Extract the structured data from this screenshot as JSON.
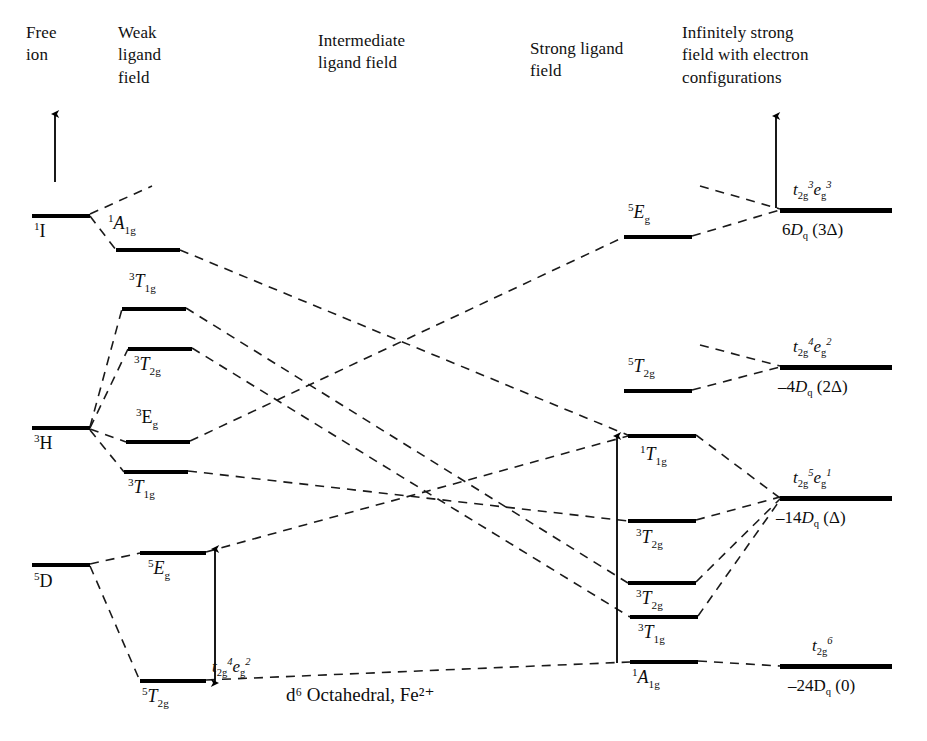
{
  "diagram": {
    "caption": "d6 Octahedral, Fe2+",
    "caption_html": "d⁶ Octahedral, Fe²⁺",
    "type": "tanabe-sugano-correlation-diagram",
    "ion": "Fe2+",
    "configuration": "d6",
    "geometry": "Octahedral"
  },
  "columns": [
    {
      "id": "free-ion",
      "title": "Free\nion"
    },
    {
      "id": "weak-field",
      "title": "Weak\nligand\nfield"
    },
    {
      "id": "intermediate-field",
      "title": "Intermediate\nligand field"
    },
    {
      "id": "strong-field",
      "title": "Strong ligand\nfield"
    },
    {
      "id": "infinite-field",
      "title": "Infinitely strong\nfield with electron\nconfigurations"
    }
  ],
  "free_ion_levels": [
    {
      "id": "1I",
      "label_html": "<sup>1</sup>I",
      "label": "1I",
      "x": 32,
      "y": 214,
      "w": 58,
      "label_x": 34,
      "label_y": 222
    },
    {
      "id": "3H",
      "label_html": "<sup>3</sup>H",
      "label": "3H",
      "x": 32,
      "y": 426,
      "w": 58,
      "label_x": 34,
      "label_y": 434
    },
    {
      "id": "5D",
      "label_html": "<sup>5</sup>D",
      "label": "5D",
      "x": 32,
      "y": 563,
      "w": 58,
      "label_x": 34,
      "label_y": 572
    }
  ],
  "weak_field_levels": [
    {
      "id": "1A1g",
      "label_html": "<sup>1</sup><i>A</i><sub>1g</sub>",
      "label": "1A1g",
      "x": 116,
      "y": 248,
      "w": 64,
      "label_x": 108,
      "label_y": 214
    },
    {
      "id": "3T1g_a",
      "label_html": "<sup>3</sup><i>T</i><sub>1g</sub>",
      "label": "3T1g",
      "x": 122,
      "y": 307,
      "w": 64,
      "label_x": 129,
      "label_y": 272
    },
    {
      "id": "3T2g",
      "label_html": "<sup>3</sup><i>T</i><sub>2g</sub>",
      "label": "3T2g",
      "x": 128,
      "y": 347,
      "w": 64,
      "label_x": 134,
      "label_y": 355
    },
    {
      "id": "3Eg",
      "label_html": "<sup>3</sup>E<sub>g</sub>",
      "label": "3Eg",
      "x": 126,
      "y": 440,
      "w": 64,
      "label_x": 136,
      "label_y": 408
    },
    {
      "id": "3T1g_b",
      "label_html": "<sup>3</sup><i>T</i><sub>1g</sub>",
      "label": "3T1g",
      "x": 124,
      "y": 470,
      "w": 64,
      "label_x": 128,
      "label_y": 478
    },
    {
      "id": "5Eg",
      "label_html": "<sup>5</sup><i>E</i><sub>g</sub>",
      "label": "5Eg",
      "x": 140,
      "y": 551,
      "w": 66,
      "label_x": 148,
      "label_y": 559
    },
    {
      "id": "5T2g",
      "label_html": "<sup>5</sup><i>T</i><sub>2g</sub>",
      "label": "5T2g",
      "x": 140,
      "y": 679,
      "w": 66,
      "label_x": 142,
      "label_y": 687
    }
  ],
  "strong_field_levels": [
    {
      "id": "5Eg_s",
      "label_html": "<sup>5</sup><i>E</i><sub>g</sub>",
      "label": "5Eg",
      "x": 624,
      "y": 235,
      "w": 68,
      "label_x": 628,
      "label_y": 203
    },
    {
      "id": "5T2g_s",
      "label_html": "<sup>5</sup><i>T</i><sub>2g</sub>",
      "label": "5T2g",
      "x": 624,
      "y": 389,
      "w": 68,
      "label_x": 628,
      "label_y": 357
    },
    {
      "id": "1T1g_s",
      "label_html": "<sup>1</sup><i>T</i><sub>1g</sub>",
      "label": "1T1g",
      "x": 628,
      "y": 434,
      "w": 68,
      "label_x": 640,
      "label_y": 445
    },
    {
      "id": "3T2g_s1",
      "label_html": "<sup>3</sup><i>T</i><sub>2g</sub>",
      "label": "3T2g",
      "x": 628,
      "y": 519,
      "w": 68,
      "label_x": 636,
      "label_y": 528
    },
    {
      "id": "3T2g_s2",
      "label_html": "<sup>3</sup><i>T</i><sub>2g</sub>",
      "label": "3T2g",
      "x": 628,
      "y": 581,
      "w": 68,
      "label_x": 636,
      "label_y": 589
    },
    {
      "id": "3T1g_s",
      "label_html": "<sup>3</sup><i>T</i><sub>1g</sub>",
      "label": "3T1g",
      "x": 630,
      "y": 615,
      "w": 68,
      "label_x": 638,
      "label_y": 623
    },
    {
      "id": "1A1g_s",
      "label_html": "<sup>1</sup><i>A</i><sub>1g</sub>",
      "label": "1A1g",
      "x": 630,
      "y": 660,
      "w": 68,
      "label_x": 632,
      "label_y": 668
    }
  ],
  "infinite_field_levels": [
    {
      "id": "t2g3eg3",
      "config_html": "<i>t</i><sub>2g</sub><sup>3</sup><i>e</i><sub>g</sub><sup>3</sup>",
      "config": "t2g3eg3",
      "energy_html": "6<i>D</i><sub>q</sub> (3Δ)",
      "energy": "6Dq (3Δ)",
      "x": 780,
      "y": 208,
      "w": 112,
      "config_x": 793,
      "config_y": 180,
      "energy_x": 782,
      "energy_y": 220
    },
    {
      "id": "t2g4eg2",
      "config_html": "<i>t</i><sub>2g</sub><sup>4</sup><i>e</i><sub>g</sub><sup>2</sup>",
      "config": "t2g4eg2",
      "energy_html": "–4<i>D</i><sub>q</sub> (2Δ)",
      "energy": "-4Dq (2Δ)",
      "x": 780,
      "y": 365,
      "w": 112,
      "config_x": 793,
      "config_y": 337,
      "energy_x": 778,
      "energy_y": 377
    },
    {
      "id": "t2g5eg1",
      "config_html": "<i>t</i><sub>2g</sub><sup>5</sup><i>e</i><sub>g</sub><sup>1</sup>",
      "config": "t2g5eg1",
      "energy_html": "–14<i>D</i><sub>q</sub> (Δ)",
      "energy": "-14Dq (Δ)",
      "x": 780,
      "y": 496,
      "w": 112,
      "config_x": 793,
      "config_y": 468,
      "energy_x": 776,
      "energy_y": 508
    },
    {
      "id": "t2g6",
      "config_html": "<i>t</i><sub>2g</sub><sup>6</sup>",
      "config": "t2g6",
      "energy_html": "–24D<sub>q</sub> (0)",
      "energy": "-24Dq (0)",
      "x": 780,
      "y": 664,
      "w": 112,
      "config_x": 812,
      "config_y": 636,
      "energy_x": 788,
      "energy_y": 676
    }
  ],
  "annotations": [
    {
      "id": "weak-config",
      "html": "<i>t</i><sub>2g</sub><sup>4</sup><i>e</i><sub>g</sub><sup>2</sup>",
      "text": "t2g4eg2",
      "x": 212,
      "y": 657
    }
  ],
  "arrows": [
    {
      "id": "energy-axis-left",
      "x1": 55,
      "y1": 182,
      "x2": 55,
      "y2": 114,
      "heads": "up"
    },
    {
      "id": "energy-axis-right",
      "x1": 776,
      "y1": 208,
      "x2": 776,
      "y2": 116,
      "heads": "up"
    },
    {
      "id": "weak-splitting-arrow",
      "x1": 215,
      "y1": 683,
      "x2": 215,
      "y2": 549,
      "heads": "both"
    },
    {
      "id": "strong-splitting-arrow",
      "x1": 617,
      "y1": 663,
      "x2": 617,
      "y2": 436,
      "heads": "up"
    }
  ],
  "correlation_lines": [
    {
      "id": "1I-to-1A1g",
      "x1": 90,
      "y1": 216,
      "x2": 116,
      "y2": 250
    },
    {
      "id": "1I-up-right",
      "x1": 90,
      "y1": 214,
      "x2": 152,
      "y2": 186
    },
    {
      "id": "1A1g-to-cross",
      "x1": 180,
      "y1": 250,
      "x2": 630,
      "y2": 436
    },
    {
      "id": "3H-to-3T1g-a",
      "x1": 90,
      "y1": 427,
      "x2": 122,
      "y2": 309
    },
    {
      "id": "3H-to-3T2g",
      "x1": 90,
      "y1": 428,
      "x2": 128,
      "y2": 349
    },
    {
      "id": "3H-to-3Eg",
      "x1": 90,
      "y1": 429,
      "x2": 126,
      "y2": 442
    },
    {
      "id": "3H-to-3T1g-b",
      "x1": 90,
      "y1": 430,
      "x2": 124,
      "y2": 472
    },
    {
      "id": "3T1g-a-to-strong",
      "x1": 186,
      "y1": 308,
      "x2": 628,
      "y2": 583
    },
    {
      "id": "3T2g-to-strong",
      "x1": 192,
      "y1": 348,
      "x2": 630,
      "y2": 617
    },
    {
      "id": "3Eg-to-strong",
      "x1": 190,
      "y1": 441,
      "x2": 624,
      "y2": 237
    },
    {
      "id": "3T1g-b-to-strong",
      "x1": 188,
      "y1": 471,
      "x2": 628,
      "y2": 521
    },
    {
      "id": "5D-to-5Eg",
      "x1": 90,
      "y1": 564,
      "x2": 140,
      "y2": 553
    },
    {
      "id": "5D-to-5T2g",
      "x1": 90,
      "y1": 566,
      "x2": 140,
      "y2": 681
    },
    {
      "id": "5Eg-to-strong",
      "x1": 206,
      "y1": 552,
      "x2": 628,
      "y2": 436
    },
    {
      "id": "5T2g-to-strong",
      "x1": 206,
      "y1": 680,
      "x2": 630,
      "y2": 662
    },
    {
      "id": "s-5Eg-to-t2g3eg3",
      "x1": 692,
      "y1": 236,
      "x2": 780,
      "y2": 210
    },
    {
      "id": "s-upper-to-t2g3eg3",
      "x1": 700,
      "y1": 186,
      "x2": 780,
      "y2": 209
    },
    {
      "id": "s-5T2g-to-t2g4eg2",
      "x1": 692,
      "y1": 390,
      "x2": 780,
      "y2": 367
    },
    {
      "id": "s-extra-to-t2g4eg2",
      "x1": 700,
      "y1": 345,
      "x2": 780,
      "y2": 366
    },
    {
      "id": "s-1T1g-to-t2g5eg1",
      "x1": 696,
      "y1": 435,
      "x2": 780,
      "y2": 498
    },
    {
      "id": "s-3T2g1-to-t2g5eg1",
      "x1": 696,
      "y1": 520,
      "x2": 780,
      "y2": 497
    },
    {
      "id": "s-3T2g2-to-t2g5eg1",
      "x1": 696,
      "y1": 582,
      "x2": 780,
      "y2": 499
    },
    {
      "id": "s-3T1g-to-t2g5eg1",
      "x1": 698,
      "y1": 616,
      "x2": 780,
      "y2": 500
    },
    {
      "id": "s-1A1g-to-t2g6",
      "x1": 698,
      "y1": 661,
      "x2": 780,
      "y2": 666
    }
  ]
}
